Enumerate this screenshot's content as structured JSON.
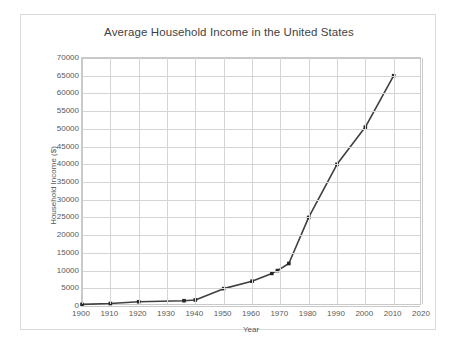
{
  "chart_data": {
    "type": "line",
    "title": "Average Household Income in the United States",
    "xlabel": "Year",
    "ylabel": "Household Income ($)",
    "xlim": [
      1900,
      2020
    ],
    "ylim": [
      0,
      70000
    ],
    "x_ticks": [
      1900,
      1910,
      1920,
      1930,
      1940,
      1950,
      1960,
      1970,
      1980,
      1990,
      2000,
      2010,
      2020
    ],
    "y_ticks": [
      0,
      5000,
      10000,
      15000,
      20000,
      25000,
      30000,
      35000,
      40000,
      45000,
      50000,
      55000,
      60000,
      65000,
      70000
    ],
    "grid": true,
    "legend": "none",
    "marker": "square",
    "line_color": "#404040",
    "marker_color": "#262626",
    "grid_color": "#d5d5d5",
    "series": [
      {
        "name": "Average Household Income",
        "points": [
          {
            "x": 1900,
            "y": 450
          },
          {
            "x": 1910,
            "y": 700
          },
          {
            "x": 1920,
            "y": 1200
          },
          {
            "x": 1936,
            "y": 1500
          },
          {
            "x": 1940,
            "y": 1700
          },
          {
            "x": 1950,
            "y": 4900
          },
          {
            "x": 1960,
            "y": 7000
          },
          {
            "x": 1967,
            "y": 9200
          },
          {
            "x": 1969,
            "y": 10000
          },
          {
            "x": 1973,
            "y": 12000
          },
          {
            "x": 1980,
            "y": 25000
          },
          {
            "x": 1990,
            "y": 40000
          },
          {
            "x": 2000,
            "y": 50500
          },
          {
            "x": 2010,
            "y": 65000
          }
        ]
      }
    ]
  }
}
